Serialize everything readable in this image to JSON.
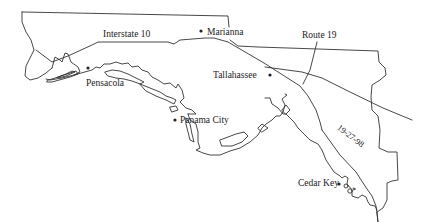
{
  "map": {
    "region": "Florida Panhandle and Big Bend",
    "line_color": "#333333",
    "background": "#ffffff",
    "cities": [
      {
        "name": "Marianna",
        "label": "Marianna"
      },
      {
        "name": "Tallahassee",
        "label": "Tallahassee"
      },
      {
        "name": "Pensacola",
        "label": "Pensacola"
      },
      {
        "name": "Panama City",
        "label": "Panama City"
      },
      {
        "name": "Cedar Key",
        "label": "Cedar Key"
      }
    ],
    "roads": [
      {
        "name": "Interstate 10",
        "label": "Interstate 10"
      },
      {
        "name": "Route 19",
        "label": "Route 19"
      },
      {
        "name": "19-27-98",
        "label": "19-27-98"
      }
    ]
  }
}
